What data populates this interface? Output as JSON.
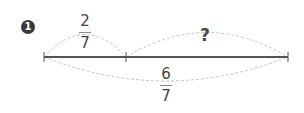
{
  "problem": {
    "number": "1",
    "segment_left": {
      "numerator": "2",
      "denominator": "7"
    },
    "segment_right": {
      "label": "?"
    },
    "whole": {
      "numerator": "6",
      "denominator": "7"
    }
  },
  "colors": {
    "line": "#555555",
    "arc": "#bbbbbb",
    "badge": "#3a3a3a",
    "text": "#444444"
  }
}
